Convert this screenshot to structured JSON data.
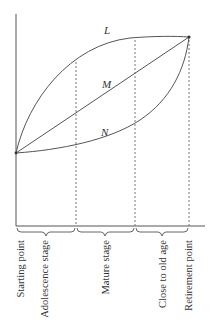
{
  "diagram": {
    "curves": [
      {
        "id": "L",
        "label": "L",
        "shape": "concave"
      },
      {
        "id": "M",
        "label": "M",
        "shape": "linear"
      },
      {
        "id": "N",
        "label": "N",
        "shape": "convex"
      }
    ],
    "stage_labels": [
      "Starting point",
      "Adolescence stage",
      "Mature stage",
      "Close to old age",
      "Retirement point"
    ]
  }
}
